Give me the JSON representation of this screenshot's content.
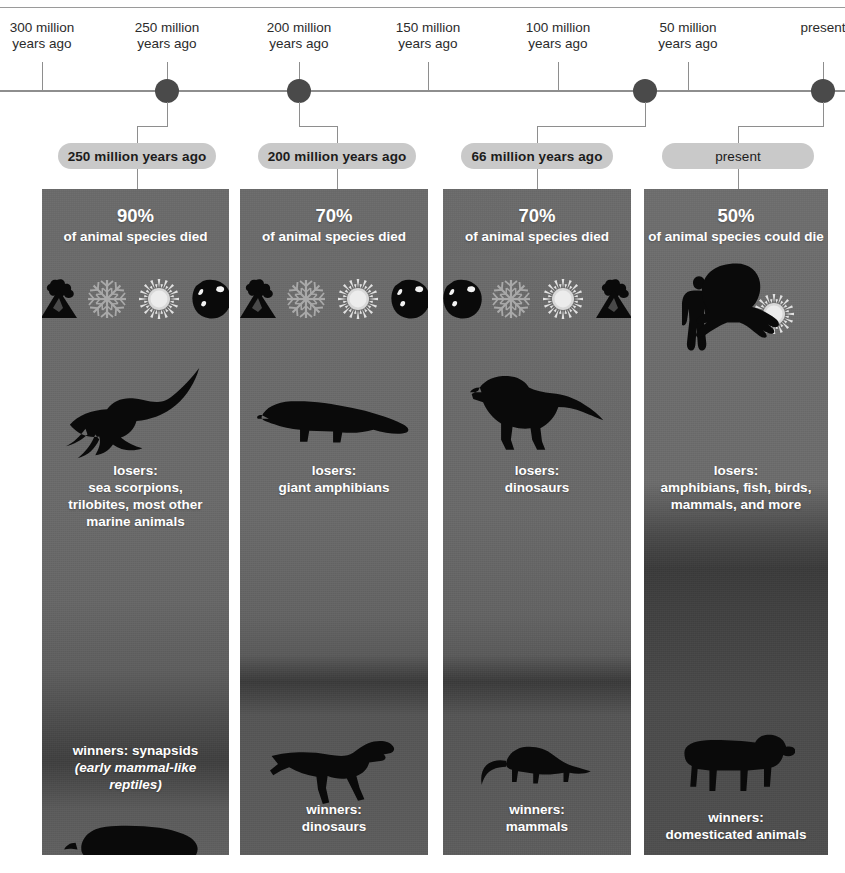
{
  "timeline": {
    "ticks": [
      {
        "id": "t300",
        "lines": [
          "300 million",
          "years ago"
        ],
        "x": 42,
        "dot": false
      },
      {
        "id": "t250",
        "lines": [
          "250 million",
          "years ago"
        ],
        "x": 167,
        "dot": true
      },
      {
        "id": "t200",
        "lines": [
          "200 million",
          "years ago"
        ],
        "x": 299,
        "dot": true
      },
      {
        "id": "t150",
        "lines": [
          "150 million",
          "years ago"
        ],
        "x": 428,
        "dot": false
      },
      {
        "id": "t100",
        "lines": [
          "100 million",
          "years ago"
        ],
        "x": 558,
        "dot": false
      },
      {
        "id": "t50",
        "lines": [
          "50 million",
          "years ago"
        ],
        "x": 688,
        "dot": false
      },
      {
        "id": "tnow",
        "lines": [
          "present"
        ],
        "x": 823,
        "dot": true
      }
    ],
    "event_dots": [
      {
        "id": "d250",
        "x": 167
      },
      {
        "id": "d200",
        "x": 299
      },
      {
        "id": "d66",
        "x": 645
      },
      {
        "id": "dnow",
        "x": 823
      }
    ]
  },
  "colors": {
    "pill_background": "#c9c9c9",
    "pill_text": "#1c1c1c",
    "axis": "#8e8e8e",
    "dot": "#4a4a4a",
    "panel_text": "#ffffff",
    "silhouette": "#0a0a0a"
  },
  "events": [
    {
      "id": "event-250",
      "pill_label": "250 million years ago",
      "pill_bold": true,
      "percent": "90%",
      "percent_sub": "of animal species died",
      "icons": [
        "volcano-icon",
        "snowflake-icon",
        "sun-icon",
        "asteroid-icon"
      ],
      "icon_layout": "row",
      "losers_label": "losers:",
      "losers_lines": [
        "sea scorpions,",
        "trilobites, most other",
        "marine animals"
      ],
      "losers_creature": "sea-scorpion-silhouette",
      "winners_label": "winners: synapsids",
      "winners_note": "(early mammal-like reptiles)",
      "winners_creature": "synapsid-silhouette"
    },
    {
      "id": "event-200",
      "pill_label": "200 million years ago",
      "pill_bold": true,
      "percent": "70%",
      "percent_sub": "of animal species died",
      "icons": [
        "volcano-icon",
        "snowflake-icon",
        "sun-icon",
        "asteroid-icon"
      ],
      "icon_layout": "row",
      "losers_label": "losers:",
      "losers_lines": [
        "giant amphibians"
      ],
      "losers_creature": "giant-amphibian-silhouette",
      "winners_label": "winners:",
      "winners_note": "dinosaurs",
      "winners_creature": "raptor-dinosaur-silhouette"
    },
    {
      "id": "event-66",
      "pill_label": "66 million years ago",
      "pill_bold": true,
      "percent": "70%",
      "percent_sub": "of animal species died",
      "icons": [
        "asteroid-icon",
        "snowflake-icon",
        "sun-icon",
        "volcano-icon"
      ],
      "icon_layout": "row",
      "losers_label": "losers:",
      "losers_lines": [
        "dinosaurs"
      ],
      "losers_creature": "tyrannosaur-silhouette",
      "winners_label": "winners:",
      "winners_note": "mammals",
      "winners_creature": "early-mammal-silhouette"
    },
    {
      "id": "event-present",
      "pill_label": "present",
      "pill_bold": false,
      "percent": "50%",
      "percent_sub": "of animal species could die",
      "icons": [
        "human-icon",
        "sun-icon"
      ],
      "icon_layout": "sparse",
      "losers_label": "losers:",
      "losers_lines": [
        "amphibians, fish, birds,",
        "mammals, and more"
      ],
      "losers_creature": "frog-silhouette",
      "winners_label": "winners:",
      "winners_note": "domesticated animals",
      "winners_creature": "cow-silhouette"
    }
  ]
}
